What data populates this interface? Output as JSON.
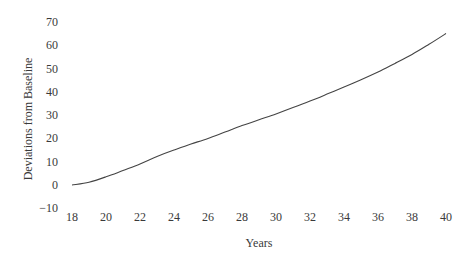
{
  "chart_data": {
    "type": "line",
    "title": "",
    "xlabel": "Years",
    "ylabel": "Deviations from Baseline",
    "x_ticks": [
      18,
      20,
      22,
      24,
      26,
      28,
      30,
      32,
      34,
      36,
      38,
      40
    ],
    "y_ticks": [
      -10,
      0,
      10,
      20,
      30,
      40,
      50,
      60,
      70
    ],
    "xlim": [
      18,
      40
    ],
    "ylim": [
      -10,
      70
    ],
    "grid": false,
    "legend": null,
    "series": [
      {
        "name": "Deviation",
        "x": [
          18,
          19,
          20,
          21,
          22,
          23,
          24,
          25,
          26,
          27,
          28,
          29,
          30,
          31,
          32,
          33,
          34,
          35,
          36,
          37,
          38,
          39,
          40
        ],
        "values": [
          0,
          1.2,
          3.5,
          6.2,
          9,
          12.2,
          15,
          17.6,
          20,
          22.7,
          25.5,
          28,
          30.5,
          33.2,
          36,
          39,
          42,
          45.2,
          48.5,
          52.2,
          56,
          60.4,
          65
        ]
      }
    ]
  }
}
